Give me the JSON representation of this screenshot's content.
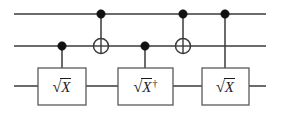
{
  "figure": {
    "kind": "quantum-circuit-diagram",
    "width": 281,
    "height": 113,
    "background_color": "#ffffff",
    "wire_color": "#3a3a3a",
    "gate_border_color": "#5a5a5a",
    "gate_fill_color": "#ffffff",
    "control_dot_color": "#111111",
    "text_color": "#1a1a1a"
  },
  "wires": [
    {
      "index": 0,
      "name": "qubit-wire-top",
      "y": 14
    },
    {
      "index": 1,
      "name": "qubit-wire-middle",
      "y": 46
    },
    {
      "index": 2,
      "name": "qubit-wire-bottom",
      "y": 86
    }
  ],
  "wire_extent": {
    "x_start": 14,
    "x_end": 266
  },
  "columns": [
    {
      "index": 0,
      "name": "column-sqrt-x-controlled",
      "x": 62,
      "control_wire": 1,
      "target_wire": 2,
      "kind": "controlled-gate",
      "gate_label": "sqrtX"
    },
    {
      "index": 1,
      "name": "column-cnot-1",
      "x": 101,
      "control_wire": 0,
      "target_wire": 1,
      "kind": "cnot"
    },
    {
      "index": 2,
      "name": "column-sqrt-x-dagger-controlled",
      "x": 145,
      "control_wire": 1,
      "target_wire": 2,
      "kind": "controlled-gate",
      "gate_label": "sqrtXdag"
    },
    {
      "index": 3,
      "name": "column-cnot-2",
      "x": 183,
      "control_wire": 0,
      "target_wire": 1,
      "kind": "cnot"
    },
    {
      "index": 4,
      "name": "column-sqrt-x-controlled-2",
      "x": 225,
      "control_wire": 0,
      "target_wire": 2,
      "kind": "controlled-gate",
      "gate_label": "sqrtX"
    }
  ],
  "gates": [
    {
      "id": "gate-1",
      "name": "sqrt-x-gate-1",
      "label": "√X",
      "radical": "√",
      "operand": "X",
      "dagger": "",
      "has_dagger": false,
      "wire": 2,
      "box": {
        "x": 38,
        "y": 68,
        "width": 48,
        "height": 37
      }
    },
    {
      "id": "gate-2",
      "name": "sqrt-x-dagger-gate",
      "label": "√X†",
      "radical": "√",
      "operand": "X",
      "dagger": "†",
      "has_dagger": true,
      "wire": 2,
      "box": {
        "x": 118,
        "y": 68,
        "width": 55,
        "height": 37
      }
    },
    {
      "id": "gate-3",
      "name": "sqrt-x-gate-2",
      "label": "√X",
      "radical": "√",
      "operand": "X",
      "dagger": "",
      "has_dagger": false,
      "wire": 2,
      "box": {
        "x": 202,
        "y": 68,
        "width": 47,
        "height": 37
      }
    }
  ],
  "control_dots": [
    {
      "name": "control-dot-col0-wire1",
      "cx": 62,
      "cy": 46,
      "r": 4.2
    },
    {
      "name": "control-dot-col1-wire0",
      "cx": 101,
      "cy": 14,
      "r": 4.2
    },
    {
      "name": "control-dot-col2-wire1",
      "cx": 145,
      "cy": 46,
      "r": 4.2
    },
    {
      "name": "control-dot-col3-wire0",
      "cx": 183,
      "cy": 14,
      "r": 4.2
    },
    {
      "name": "control-dot-col4-wire0",
      "cx": 225,
      "cy": 14,
      "r": 4.2
    }
  ],
  "targets": [
    {
      "name": "cnot-target-col1",
      "cx": 101,
      "cy": 46,
      "r": 7.5
    },
    {
      "name": "cnot-target-col3",
      "cx": 183,
      "cy": 46,
      "r": 7.5
    }
  ],
  "connectors": [
    {
      "name": "connector-col0",
      "x": 62,
      "y1": 46,
      "y2": 68
    },
    {
      "name": "connector-col1",
      "x": 101,
      "y1": 14,
      "y2": 38.5
    },
    {
      "name": "connector-col2",
      "x": 145,
      "y1": 46,
      "y2": 68
    },
    {
      "name": "connector-col3",
      "x": 183,
      "y1": 14,
      "y2": 38.5
    },
    {
      "name": "connector-col4",
      "x": 225,
      "y1": 14,
      "y2": 68
    }
  ]
}
